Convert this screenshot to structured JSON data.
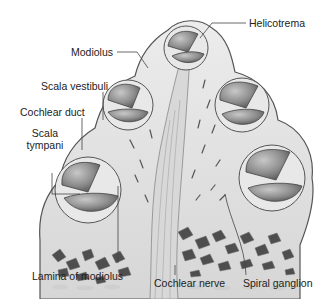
{
  "diagram": {
    "colors": {
      "bone": "#e4e4e4",
      "outline": "#555555",
      "chamber": "#9a9a9a",
      "chamber_dark": "#6e6e6e",
      "spongy_bone": "#4a4a4a",
      "label_text": "#222222",
      "leader_line": "#444444"
    },
    "labels": {
      "helicotrema": "Helicotrema",
      "modiolus": "Modiolus",
      "scala_vestibuli": "Scala vestibuli",
      "cochlear_duct": "Cochlear duct",
      "scala_tympani_line1": "Scala",
      "scala_tympani_line2": "tympani",
      "lamina_of_modiolus": "Lamina of modiolus",
      "cochlear_nerve": "Cochlear nerve",
      "spiral_ganglion": "Spiral ganglion"
    }
  }
}
